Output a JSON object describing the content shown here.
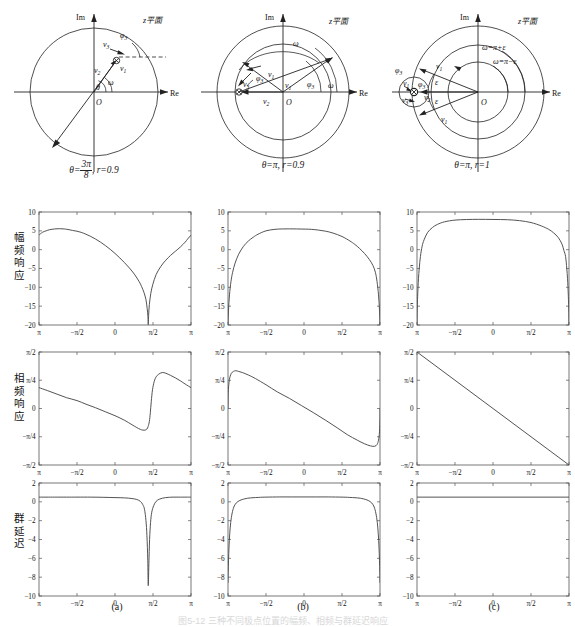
{
  "figure": {
    "caption": "图5-12 三种不同极点位置的幅频、相频与群延迟响应",
    "column_labels": [
      "(a)",
      "(b)",
      "(c)"
    ],
    "row_labels": [
      {
        "id": "magnitude",
        "text": "幅频响应"
      },
      {
        "id": "phase",
        "text": "相频响应"
      },
      {
        "id": "group_delay",
        "text": "群延迟"
      }
    ]
  },
  "zplane": {
    "plane_label": "z平面",
    "axis_im": "Im",
    "axis_re": "Re",
    "origin": "O",
    "panels": [
      {
        "id": "a",
        "caption": "θ=3π/8 , r=0.9",
        "caption_parts": {
          "theta": "θ=",
          "frac_num": "3π",
          "frac_den": "8",
          "rterm": ", r=0.9"
        },
        "labels": [
          "v3",
          "v1",
          "v2",
          "φ3",
          "ω",
          "θ"
        ],
        "pole_angle_deg": 67.5,
        "pole_radius": 0.9
      },
      {
        "id": "b",
        "caption": "θ=π, r=0.9",
        "labels": [
          "v3",
          "v1",
          "v2",
          "φ3",
          "ω"
        ],
        "pole_angle_deg": 180,
        "pole_radius": 0.9
      },
      {
        "id": "c",
        "caption": "θ=π, r=1",
        "labels": [
          "v3",
          "v1",
          "v2",
          "φ3",
          "ε",
          "ω=π+ε",
          "ω=π−ε"
        ],
        "pole_angle_deg": 180,
        "pole_radius": 1.0
      }
    ]
  },
  "chart_data": [
    {
      "id": "a-magnitude",
      "type": "line",
      "title": "",
      "xlabel": "",
      "ylabel": "幅频响应",
      "xlim": [
        -3.14159,
        3.14159
      ],
      "ylim": [
        -20,
        10
      ],
      "xticks": [
        -3.14159,
        -1.5708,
        0,
        1.5708,
        3.14159
      ],
      "xticklabels": [
        "π",
        "−π/2",
        "0",
        "π/2",
        "π"
      ],
      "yticks": [
        -20,
        -15,
        -10,
        -5,
        0,
        5,
        10
      ],
      "yticklabels": [
        "−20",
        "−15",
        "−10",
        "−5",
        "0",
        "5",
        "10"
      ],
      "grid": false,
      "series": [
        {
          "name": "|H|dB",
          "x": [
            -3.1416,
            -3.0,
            -2.85,
            -2.7,
            -2.5,
            -2.3,
            -2.1,
            -1.9,
            -1.75,
            -1.5708,
            -1.4,
            -1.2,
            -1.0,
            -0.8,
            -0.6,
            -0.4,
            -0.2,
            0,
            0.2,
            0.4,
            0.6,
            0.8,
            1.0,
            1.1,
            1.2,
            1.28,
            1.33,
            1.36,
            1.3744,
            1.39,
            1.42,
            1.48,
            1.56,
            1.7,
            1.9,
            2.1,
            2.3,
            2.5,
            2.7,
            2.9,
            3.0,
            3.1416
          ],
          "values": [
            3.9,
            4.6,
            5.0,
            5.3,
            5.5,
            5.57,
            5.5,
            5.3,
            5.1,
            4.9,
            4.6,
            4.1,
            3.5,
            2.8,
            2.0,
            1.1,
            0.1,
            -1.0,
            -2.2,
            -3.5,
            -4.9,
            -6.5,
            -8.5,
            -9.8,
            -11.4,
            -13.3,
            -15.6,
            -17.6,
            -19.9,
            -17.4,
            -14.6,
            -11.6,
            -9.3,
            -6.6,
            -4.4,
            -2.8,
            -1.5,
            -0.4,
            0.7,
            2.0,
            2.8,
            3.9
          ]
        }
      ]
    },
    {
      "id": "a-phase",
      "type": "line",
      "title": "",
      "xlabel": "",
      "ylabel": "相频响应",
      "xlim": [
        -3.14159,
        3.14159
      ],
      "ylim": [
        -1.5708,
        1.5708
      ],
      "xticks": [
        -3.14159,
        -1.5708,
        0,
        1.5708,
        3.14159
      ],
      "xticklabels": [
        "π",
        "−π/2",
        "0",
        "π/2",
        "π"
      ],
      "yticks": [
        -1.5708,
        -0.7854,
        0,
        0.7854,
        1.5708
      ],
      "yticklabels": [
        "−π/2",
        "−π/4",
        "0",
        "π/4",
        "π/2"
      ],
      "grid": false,
      "series": [
        {
          "name": "arg H",
          "x": [
            -3.1416,
            -2.8,
            -2.4,
            -2.0,
            -1.5708,
            -1.2,
            -0.8,
            -0.4,
            0,
            0.4,
            0.7,
            0.9,
            1.05,
            1.15,
            1.25,
            1.32,
            1.37,
            1.42,
            1.46,
            1.5,
            1.55,
            1.62,
            1.7,
            1.8,
            1.95,
            2.1,
            2.3,
            2.5,
            2.7,
            2.9,
            3.1416
          ],
          "values": [
            0.58,
            0.5,
            0.4,
            0.3,
            0.22,
            0.12,
            0.02,
            -0.09,
            -0.2,
            -0.33,
            -0.45,
            -0.53,
            -0.58,
            -0.6,
            -0.6,
            -0.57,
            -0.5,
            -0.36,
            -0.12,
            0.2,
            0.52,
            0.75,
            0.88,
            0.95,
            1.0,
            0.98,
            0.92,
            0.85,
            0.77,
            0.68,
            0.58
          ]
        }
      ]
    },
    {
      "id": "a-group-delay",
      "type": "line",
      "title": "",
      "xlabel": "",
      "ylabel": "群延迟",
      "xlim": [
        -3.14159,
        3.14159
      ],
      "ylim": [
        -10,
        2
      ],
      "xticks": [
        -3.14159,
        -1.5708,
        0,
        1.5708,
        3.14159
      ],
      "xticklabels": [
        "π",
        "−π/2",
        "0",
        "π/2",
        "π"
      ],
      "yticks": [
        -10,
        -8,
        -6,
        -4,
        -2,
        0,
        2
      ],
      "yticklabels": [
        "−10",
        "−8",
        "−6",
        "−4",
        "−2",
        "0",
        "2"
      ],
      "grid": false,
      "series": [
        {
          "name": "τ",
          "x": [
            -3.1416,
            -2.5,
            -2.0,
            -1.5708,
            -1.0,
            -0.5,
            0,
            0.4,
            0.7,
            0.9,
            1.05,
            1.15,
            1.22,
            1.28,
            1.32,
            1.355,
            1.3744,
            1.4,
            1.43,
            1.47,
            1.52,
            1.6,
            1.7,
            1.85,
            2.1,
            2.4,
            2.7,
            3.0,
            3.1416
          ],
          "values": [
            0.5,
            0.5,
            0.5,
            0.5,
            0.5,
            0.48,
            0.45,
            0.42,
            0.35,
            0.25,
            0.05,
            -0.3,
            -0.8,
            -2.0,
            -3.6,
            -6.2,
            -8.9,
            -6.6,
            -4.0,
            -2.2,
            -1.1,
            -0.4,
            0.05,
            0.3,
            0.45,
            0.5,
            0.5,
            0.5,
            0.5
          ]
        }
      ]
    },
    {
      "id": "b-magnitude",
      "type": "line",
      "title": "",
      "xlabel": "",
      "ylabel": "幅频响应",
      "xlim": [
        -3.14159,
        3.14159
      ],
      "ylim": [
        -20,
        10
      ],
      "xticks": [
        -3.14159,
        -1.5708,
        0,
        1.5708,
        3.14159
      ],
      "xticklabels": [
        "π",
        "−π/2",
        "0",
        "π/2",
        "π"
      ],
      "yticks": [
        -20,
        -15,
        -10,
        -5,
        0,
        5,
        10
      ],
      "yticklabels": [
        "−20",
        "−15",
        "−10",
        "−5",
        "0",
        "5",
        "10"
      ],
      "grid": false,
      "series": [
        {
          "name": "|H|dB",
          "x": [
            -3.1416,
            -3.12,
            -3.08,
            -3.02,
            -2.95,
            -2.85,
            -2.7,
            -2.5,
            -2.3,
            -2.1,
            -1.9,
            -1.5708,
            -1.2,
            -0.9,
            -0.6,
            -0.3,
            0.05,
            0.3,
            0.6,
            0.9,
            1.2,
            1.5708,
            1.9,
            2.1,
            2.3,
            2.5,
            2.7,
            2.85,
            2.95,
            3.02,
            3.08,
            3.12,
            3.1416
          ],
          "values": [
            -19.9,
            -16.0,
            -12.0,
            -8.5,
            -6.0,
            -3.6,
            -1.2,
            0.9,
            2.3,
            3.3,
            4.1,
            5.0,
            5.4,
            5.5,
            5.52,
            5.5,
            5.45,
            5.4,
            5.2,
            4.9,
            4.4,
            3.5,
            2.3,
            1.4,
            0.3,
            -1.0,
            -2.6,
            -4.2,
            -6.0,
            -8.5,
            -12.0,
            -16.0,
            -19.9
          ]
        }
      ]
    },
    {
      "id": "b-phase",
      "type": "line",
      "title": "",
      "xlabel": "",
      "ylabel": "相频响应",
      "xlim": [
        -3.14159,
        3.14159
      ],
      "ylim": [
        -1.5708,
        1.5708
      ],
      "xticks": [
        -3.14159,
        -1.5708,
        0,
        1.5708,
        3.14159
      ],
      "xticklabels": [
        "π",
        "−π/2",
        "0",
        "π/2",
        "π"
      ],
      "yticks": [
        -1.5708,
        -0.7854,
        0,
        0.7854,
        1.5708
      ],
      "yticklabels": [
        "−π/2",
        "−π/4",
        "0",
        "π/4",
        "π/2"
      ],
      "grid": false,
      "series": [
        {
          "name": "arg H",
          "x": [
            -3.1416,
            -3.13,
            -3.1,
            -3.06,
            -3.0,
            -2.92,
            -2.82,
            -2.7,
            -2.55,
            -2.4,
            -2.2,
            -2.0,
            -1.5708,
            -1.1,
            -0.6,
            -0.1,
            0.4,
            0.9,
            1.4,
            1.8,
            2.2,
            2.5,
            2.75,
            2.92,
            3.02,
            3.08,
            3.12,
            3.14,
            3.1416
          ],
          "values": [
            0.0,
            0.45,
            0.72,
            0.88,
            0.98,
            1.03,
            1.05,
            1.03,
            1.0,
            0.96,
            0.9,
            0.83,
            0.66,
            0.46,
            0.28,
            0.08,
            -0.12,
            -0.33,
            -0.55,
            -0.73,
            -0.88,
            -0.98,
            -1.04,
            -1.05,
            -1.0,
            -0.88,
            -0.65,
            -0.25,
            0.0
          ]
        }
      ]
    },
    {
      "id": "b-group-delay",
      "type": "line",
      "title": "",
      "xlabel": "",
      "ylabel": "群延迟",
      "xlim": [
        -3.14159,
        3.14159
      ],
      "ylim": [
        -10,
        2
      ],
      "xticks": [
        -3.14159,
        -1.5708,
        0,
        1.5708,
        3.14159
      ],
      "xticklabels": [
        "π",
        "−π/2",
        "0",
        "π/2",
        "π"
      ],
      "yticks": [
        -10,
        -8,
        -6,
        -4,
        -2,
        0,
        2
      ],
      "yticklabels": [
        "−10",
        "−8",
        "−6",
        "−4",
        "−2",
        "0",
        "2"
      ],
      "grid": false,
      "series": [
        {
          "name": "τ",
          "x": [
            -3.1416,
            -3.135,
            -3.12,
            -3.1,
            -3.07,
            -3.03,
            -2.97,
            -2.9,
            -2.8,
            -2.65,
            -2.45,
            -2.2,
            -1.8,
            -1.5708,
            -1.0,
            -0.5,
            0,
            0.5,
            1.0,
            1.5708,
            1.8,
            2.2,
            2.45,
            2.65,
            2.8,
            2.9,
            2.97,
            3.03,
            3.07,
            3.1,
            3.12,
            3.135,
            3.1416
          ],
          "values": [
            -8.6,
            -7.5,
            -6.2,
            -4.8,
            -3.4,
            -2.2,
            -1.2,
            -0.55,
            -0.12,
            0.15,
            0.32,
            0.42,
            0.48,
            0.5,
            0.52,
            0.52,
            0.52,
            0.52,
            0.52,
            0.5,
            0.48,
            0.42,
            0.32,
            0.15,
            -0.12,
            -0.55,
            -1.2,
            -2.2,
            -3.4,
            -4.8,
            -6.2,
            -7.5,
            -8.6
          ]
        }
      ]
    },
    {
      "id": "c-magnitude",
      "type": "line",
      "title": "",
      "xlabel": "",
      "ylabel": "幅频响应",
      "xlim": [
        -3.14159,
        3.14159
      ],
      "ylim": [
        -20,
        10
      ],
      "xticks": [
        -3.14159,
        -1.5708,
        0,
        1.5708,
        3.14159
      ],
      "xticklabels": [
        "π",
        "−π/2",
        "0",
        "π/2",
        "π"
      ],
      "yticks": [
        -20,
        -15,
        -10,
        -5,
        0,
        5,
        10
      ],
      "yticklabels": [
        "−20",
        "−15",
        "−10",
        "−5",
        "0",
        "5",
        "10"
      ],
      "grid": false,
      "series": [
        {
          "name": "|H|dB",
          "x": [
            -3.1416,
            -3.13,
            -3.115,
            -3.1,
            -3.08,
            -3.05,
            -3.0,
            -2.93,
            -2.85,
            -2.7,
            -2.5,
            -2.3,
            -2.0,
            -1.5708,
            -1.1,
            -0.6,
            0,
            0.6,
            1.1,
            1.5708,
            2.0,
            2.3,
            2.5,
            2.7,
            2.85,
            2.93,
            3.0,
            3.05,
            3.08,
            3.1,
            3.115,
            3.13,
            3.1416
          ],
          "values": [
            -20.0,
            -15.5,
            -12.5,
            -10.0,
            -7.6,
            -5.0,
            -1.8,
            0.9,
            2.6,
            4.6,
            5.9,
            6.7,
            7.4,
            7.85,
            8.0,
            8.05,
            8.02,
            7.95,
            7.7,
            7.2,
            6.3,
            5.4,
            4.5,
            3.2,
            1.5,
            -0.2,
            -1.8,
            -5.0,
            -7.6,
            -10.0,
            -12.5,
            -15.5,
            -20.0
          ]
        }
      ]
    },
    {
      "id": "c-phase",
      "type": "line",
      "title": "",
      "xlabel": "",
      "ylabel": "相频响应",
      "xlim": [
        -3.14159,
        3.14159
      ],
      "ylim": [
        -1.5708,
        1.5708
      ],
      "xticks": [
        -3.14159,
        -1.5708,
        0,
        1.5708,
        3.14159
      ],
      "xticklabels": [
        "π",
        "−π/2",
        "0",
        "π/2",
        "π"
      ],
      "yticks": [
        -1.5708,
        -0.7854,
        0,
        0.7854,
        1.5708
      ],
      "yticklabels": [
        "−π/2",
        "−π/4",
        "0",
        "π/4",
        "π/2"
      ],
      "grid": false,
      "series": [
        {
          "name": "arg H",
          "x": [
            -3.1416,
            3.1416
          ],
          "values": [
            1.5708,
            -1.5708
          ]
        }
      ]
    },
    {
      "id": "c-group-delay",
      "type": "line",
      "title": "",
      "xlabel": "",
      "ylabel": "群延迟",
      "xlim": [
        -3.14159,
        3.14159
      ],
      "ylim": [
        -10,
        2
      ],
      "xticks": [
        -3.14159,
        -1.5708,
        0,
        1.5708,
        3.14159
      ],
      "xticklabels": [
        "π",
        "−π/2",
        "0",
        "π/2",
        "π"
      ],
      "yticks": [
        -10,
        -8,
        -6,
        -4,
        -2,
        0,
        2
      ],
      "yticklabels": [
        "−10",
        "−8",
        "−6",
        "−4",
        "−2",
        "0",
        "2"
      ],
      "grid": false,
      "series": [
        {
          "name": "τ",
          "x": [
            -3.1416,
            3.1416
          ],
          "values": [
            0.5,
            0.5
          ]
        }
      ]
    }
  ]
}
